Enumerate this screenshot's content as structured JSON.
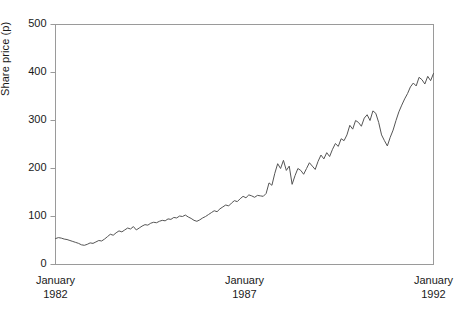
{
  "chart_data": {
    "type": "line",
    "title": "",
    "xlabel": "",
    "ylabel": "Share price (p)",
    "ylim": [
      0,
      500
    ],
    "yticks": [
      0,
      100,
      200,
      300,
      400,
      500
    ],
    "ytick_labels": [
      "0",
      "100",
      "200",
      "300",
      "400",
      "500"
    ],
    "xlim": [
      "January 1982",
      "January 1992"
    ],
    "xtick_labels": [
      {
        "line1": "January",
        "line2": "1982"
      },
      {
        "line1": "January",
        "line2": "1987"
      },
      {
        "line1": "January",
        "line2": "1992"
      }
    ],
    "grid": false,
    "legend": null,
    "line_color": "#555555",
    "frame_color": "#9a9a9a",
    "series": [
      {
        "name": "Share price",
        "units": "p",
        "values": [
          54,
          56,
          55,
          53,
          52,
          50,
          48,
          46,
          44,
          41,
          40,
          42,
          45,
          44,
          47,
          50,
          49,
          53,
          58,
          63,
          61,
          66,
          70,
          68,
          72,
          76,
          74,
          79,
          72,
          76,
          80,
          83,
          82,
          86,
          88,
          87,
          90,
          92,
          91,
          95,
          94,
          98,
          97,
          101,
          100,
          103,
          99,
          96,
          92,
          90,
          93,
          97,
          100,
          104,
          108,
          112,
          110,
          116,
          120,
          124,
          122,
          128,
          133,
          131,
          137,
          142,
          139,
          145,
          143,
          140,
          144,
          143,
          142,
          148,
          170,
          165,
          190,
          210,
          200,
          217,
          196,
          205,
          167,
          185,
          200,
          196,
          188,
          200,
          212,
          205,
          198,
          215,
          228,
          220,
          233,
          225,
          240,
          252,
          246,
          262,
          258,
          270,
          290,
          282,
          300,
          296,
          288,
          305,
          312,
          300,
          320,
          315,
          296,
          270,
          258,
          247,
          265,
          280,
          300,
          318,
          332,
          345,
          356,
          370,
          378,
          372,
          390,
          385,
          376,
          392,
          383,
          398
        ]
      }
    ]
  }
}
